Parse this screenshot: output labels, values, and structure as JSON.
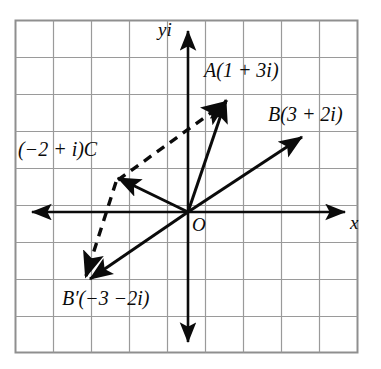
{
  "figure": {
    "background_color": "#ffffff",
    "ink_color": "#0b0b0b",
    "grid_color": "#9a9a9a",
    "border_color": "#8f8f8f",
    "grid": {
      "columns": 9,
      "rows": 9,
      "cell_size_px": 38,
      "left_px": 15,
      "top_px": 20
    },
    "axes": {
      "y_label": "yi",
      "x_label": "x",
      "origin_label": "O",
      "x_axis_arrows": [
        "left",
        "right"
      ],
      "y_axis_arrows": [
        "up",
        "down"
      ]
    },
    "points": [
      {
        "name": "A",
        "label": "A(1 + 3i)",
        "re": 1,
        "im": 3
      },
      {
        "name": "B",
        "label": "B(3 + 2i)",
        "re": 3,
        "im": 2
      },
      {
        "name": "C",
        "label": "(−2 + i)C",
        "re": -2,
        "im": 1
      },
      {
        "name": "B'",
        "label": "B′(−3 −2i)",
        "re": -3,
        "im": -2
      }
    ],
    "vectors": [
      {
        "name": "OA",
        "from": "O",
        "to": "A",
        "style": "solid",
        "arrow": "end"
      },
      {
        "name": "OB",
        "from": "O",
        "to": "B",
        "style": "solid",
        "arrow": "end"
      },
      {
        "name": "OC",
        "from": "O",
        "to": "C",
        "style": "solid",
        "arrow": "end"
      },
      {
        "name": "OB'",
        "from": "O",
        "to": "B'",
        "style": "solid",
        "arrow": "end"
      },
      {
        "name": "CA",
        "from": "C",
        "to": "A",
        "style": "dashed",
        "arrow": "end"
      },
      {
        "name": "CB'",
        "from": "C",
        "to": "B'",
        "style": "dashed",
        "arrow": "end"
      }
    ]
  }
}
